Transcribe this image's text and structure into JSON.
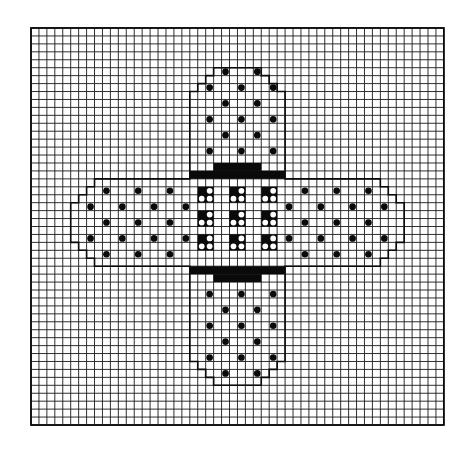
{
  "figure": {
    "grid": {
      "cols": 52,
      "rows": 50,
      "origin_x": 31,
      "origin_y": 28,
      "cell": 7.94
    },
    "colors": {
      "background": "#ffffff",
      "grid_line": "#1a1a1a",
      "ink": "#0a0a0a"
    }
  },
  "chart_data": {
    "type": "heatmap",
    "xlabel": "",
    "ylabel": "",
    "grid_cols": 52,
    "grid_rows": 50,
    "symbols": [
      {
        "name": "filled-dot",
        "meaning": "dot stitch on bandage strip"
      },
      {
        "name": "solid-block",
        "meaning": "dark band between strip and pad"
      },
      {
        "name": "black-square-with-open-circles",
        "meaning": "2x2 pad perforation motif"
      }
    ],
    "outline": [
      [
        23,
        5
      ],
      [
        29,
        5
      ],
      [
        29,
        6
      ],
      [
        30,
        6
      ],
      [
        30,
        7
      ],
      [
        31,
        7
      ],
      [
        31,
        8
      ],
      [
        32,
        8
      ],
      [
        32,
        19
      ],
      [
        44,
        19
      ],
      [
        44,
        20
      ],
      [
        45,
        20
      ],
      [
        45,
        21
      ],
      [
        46,
        21
      ],
      [
        46,
        22
      ],
      [
        47,
        22
      ],
      [
        47,
        27
      ],
      [
        46,
        27
      ],
      [
        46,
        28
      ],
      [
        45,
        28
      ],
      [
        45,
        29
      ],
      [
        44,
        29
      ],
      [
        44,
        30
      ],
      [
        32,
        30
      ],
      [
        32,
        42
      ],
      [
        31,
        42
      ],
      [
        31,
        43
      ],
      [
        30,
        43
      ],
      [
        30,
        44
      ],
      [
        29,
        44
      ],
      [
        29,
        45
      ],
      [
        23,
        45
      ],
      [
        23,
        44
      ],
      [
        22,
        44
      ],
      [
        22,
        43
      ],
      [
        21,
        43
      ],
      [
        21,
        42
      ],
      [
        20,
        42
      ],
      [
        20,
        30
      ],
      [
        8,
        30
      ],
      [
        8,
        29
      ],
      [
        7,
        29
      ],
      [
        7,
        28
      ],
      [
        6,
        28
      ],
      [
        6,
        27
      ],
      [
        5,
        27
      ],
      [
        5,
        22
      ],
      [
        6,
        22
      ],
      [
        6,
        21
      ],
      [
        7,
        21
      ],
      [
        7,
        20
      ],
      [
        8,
        20
      ],
      [
        8,
        19
      ],
      [
        20,
        19
      ],
      [
        20,
        8
      ],
      [
        21,
        8
      ],
      [
        21,
        7
      ],
      [
        22,
        7
      ],
      [
        22,
        6
      ],
      [
        23,
        6
      ]
    ],
    "bands": [
      {
        "row": 17,
        "col_start": 23,
        "col_end": 28
      },
      {
        "row": 18,
        "col_start": 20,
        "col_end": 31
      },
      {
        "row": 30,
        "col_start": 20,
        "col_end": 31
      },
      {
        "row": 31,
        "col_start": 23,
        "col_end": 28
      }
    ],
    "dots": [
      [
        24,
        5
      ],
      [
        28,
        5
      ],
      [
        22,
        7
      ],
      [
        26,
        7
      ],
      [
        30,
        7
      ],
      [
        24,
        9
      ],
      [
        28,
        9
      ],
      [
        22,
        11
      ],
      [
        26,
        11
      ],
      [
        30,
        11
      ],
      [
        24,
        13
      ],
      [
        28,
        13
      ],
      [
        22,
        15
      ],
      [
        26,
        15
      ],
      [
        30,
        15
      ],
      [
        9,
        20
      ],
      [
        13,
        20
      ],
      [
        17,
        20
      ],
      [
        7,
        22
      ],
      [
        11,
        22
      ],
      [
        15,
        22
      ],
      [
        19,
        22
      ],
      [
        9,
        24
      ],
      [
        13,
        24
      ],
      [
        17,
        24
      ],
      [
        7,
        26
      ],
      [
        11,
        26
      ],
      [
        15,
        26
      ],
      [
        19,
        26
      ],
      [
        9,
        28
      ],
      [
        13,
        28
      ],
      [
        17,
        28
      ],
      [
        34,
        20
      ],
      [
        38,
        20
      ],
      [
        42,
        20
      ],
      [
        32,
        22
      ],
      [
        36,
        22
      ],
      [
        40,
        22
      ],
      [
        44,
        22
      ],
      [
        34,
        24
      ],
      [
        38,
        24
      ],
      [
        42,
        24
      ],
      [
        32,
        26
      ],
      [
        36,
        26
      ],
      [
        40,
        26
      ],
      [
        44,
        26
      ],
      [
        34,
        28
      ],
      [
        38,
        28
      ],
      [
        42,
        28
      ],
      [
        22,
        33
      ],
      [
        26,
        33
      ],
      [
        30,
        33
      ],
      [
        24,
        35
      ],
      [
        28,
        35
      ],
      [
        22,
        37
      ],
      [
        26,
        37
      ],
      [
        30,
        37
      ],
      [
        24,
        39
      ],
      [
        28,
        39
      ],
      [
        22,
        41
      ],
      [
        26,
        41
      ],
      [
        30,
        41
      ],
      [
        24,
        43
      ],
      [
        28,
        43
      ]
    ],
    "pad_motifs": [
      [
        21,
        20
      ],
      [
        25,
        20
      ],
      [
        29,
        20
      ],
      [
        21,
        23
      ],
      [
        25,
        23
      ],
      [
        29,
        23
      ],
      [
        21,
        26
      ],
      [
        25,
        26
      ],
      [
        29,
        26
      ]
    ]
  }
}
